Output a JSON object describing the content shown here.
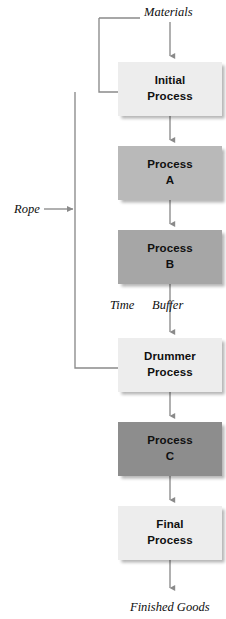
{
  "diagram": {
    "type": "flowchart",
    "nodes": [
      {
        "id": "initial",
        "line1": "Initial",
        "line2": "Process",
        "fill": "#ededed",
        "x": 118,
        "y": 62,
        "w": 104,
        "h": 54
      },
      {
        "id": "processA",
        "line1": "Process",
        "line2": "A",
        "fill": "#b9b9b9",
        "x": 118,
        "y": 146,
        "w": 104,
        "h": 54
      },
      {
        "id": "processB",
        "line1": "Process",
        "line2": "B",
        "fill": "#a6a6a6",
        "x": 118,
        "y": 230,
        "w": 104,
        "h": 54
      },
      {
        "id": "drummer",
        "line1": "Drummer",
        "line2": "Process",
        "fill": "#ededed",
        "x": 118,
        "y": 338,
        "w": 104,
        "h": 54
      },
      {
        "id": "processC",
        "line1": "Process",
        "line2": "C",
        "fill": "#8d8d8d",
        "x": 118,
        "y": 422,
        "w": 104,
        "h": 54
      },
      {
        "id": "final",
        "line1": "Final",
        "line2": "Process",
        "fill": "#ededed",
        "x": 118,
        "y": 506,
        "w": 104,
        "h": 54
      }
    ],
    "labels": [
      {
        "id": "materials",
        "text": "Materials",
        "x": 144,
        "y": 5
      },
      {
        "id": "rope",
        "text": "Rope",
        "x": 14,
        "y": 202
      },
      {
        "id": "time",
        "text": "Time",
        "x": 110,
        "y": 298
      },
      {
        "id": "buffer",
        "text": "Buffer",
        "x": 152,
        "y": 298
      },
      {
        "id": "finished-goods",
        "text": "Finished Goods",
        "x": 130,
        "y": 600
      }
    ],
    "colors": {
      "connector": "#8a8a8a",
      "box_light": "#ededed",
      "box_medium": "#b9b9b9",
      "box_medium_dark": "#a6a6a6",
      "box_dark": "#8d8d8d",
      "text": "#101010",
      "background": "#ffffff"
    }
  }
}
